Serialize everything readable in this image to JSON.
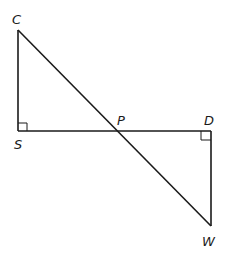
{
  "diagram": {
    "type": "geometry",
    "points": {
      "C": {
        "label": "C",
        "x": 18,
        "y": 30
      },
      "S": {
        "label": "S",
        "x": 18,
        "y": 131
      },
      "P": {
        "label": "P",
        "x": 117,
        "y": 131
      },
      "D": {
        "label": "D",
        "x": 211,
        "y": 131
      },
      "W": {
        "label": "W",
        "x": 211,
        "y": 226
      }
    },
    "segments": [
      "CS",
      "SD",
      "CW",
      "DW"
    ],
    "right_angles": [
      "S",
      "D"
    ],
    "colors": {
      "stroke": "#1a1a1a",
      "background": "#ffffff"
    }
  },
  "labels": {
    "C": "C",
    "S": "S",
    "P": "P",
    "D": "D",
    "W": "W"
  }
}
